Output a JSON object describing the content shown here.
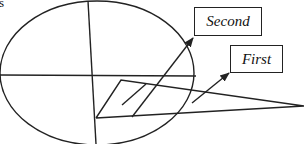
{
  "diagram": {
    "type": "geometric-figure",
    "stroke_color": "#222222",
    "background": "#ffffff",
    "top_left_fragment": "s",
    "labels": {
      "second": "Second",
      "first": "First"
    },
    "shapes": {
      "ellipse": {
        "cx": 97,
        "cy": 73,
        "rx": 97,
        "ry": 72
      },
      "vertical_axis": {
        "x1": 88,
        "y1": 1,
        "x2": 96,
        "y2": 144
      },
      "horizontal_axis": {
        "x1": 0,
        "y1": 75,
        "x2": 196,
        "y2": 76
      },
      "wedge": [
        [
          96,
          118
        ],
        [
          121,
          80
        ],
        [
          304,
          106
        ],
        [
          96,
          118
        ]
      ],
      "arrows": [
        {
          "to": "second",
          "x1": 122,
          "y1": 117,
          "x2": 193,
          "y2": 37
        },
        {
          "to": "first",
          "x1": 192,
          "y1": 103,
          "x2": 229,
          "y2": 72
        }
      ],
      "inner_stroke": {
        "x1": 122,
        "y1": 105,
        "x2": 146,
        "y2": 84
      }
    }
  }
}
